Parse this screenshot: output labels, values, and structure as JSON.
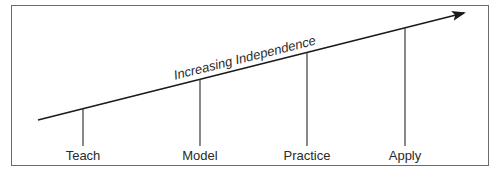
{
  "diagram": {
    "axis_label": "Increasing Independence",
    "stages": [
      {
        "label": "Teach"
      },
      {
        "label": "Model"
      },
      {
        "label": "Practice"
      },
      {
        "label": "Apply"
      }
    ],
    "colors": {
      "line": "#1a1a1a",
      "border": "#6b6b6b",
      "text": "#2a2a2a"
    }
  }
}
